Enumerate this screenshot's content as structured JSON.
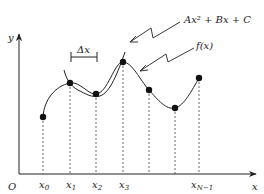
{
  "diagram": {
    "axes": {
      "x_label": "x",
      "y_label": "y",
      "origin_label": "O"
    },
    "annotations": {
      "delta": "Δx",
      "quadratic": "Ax² + Bx + C",
      "function": "f(x)"
    },
    "nodes": [
      {
        "label": "x",
        "sub": "0"
      },
      {
        "label": "x",
        "sub": "1"
      },
      {
        "label": "x",
        "sub": "2"
      },
      {
        "label": "x",
        "sub": "3"
      },
      {
        "label": "",
        "sub": ""
      },
      {
        "label": "",
        "sub": ""
      },
      {
        "label": "x",
        "sub": "N−1"
      }
    ],
    "colors": {
      "stroke": "#222222",
      "background": "#ffffff"
    }
  }
}
